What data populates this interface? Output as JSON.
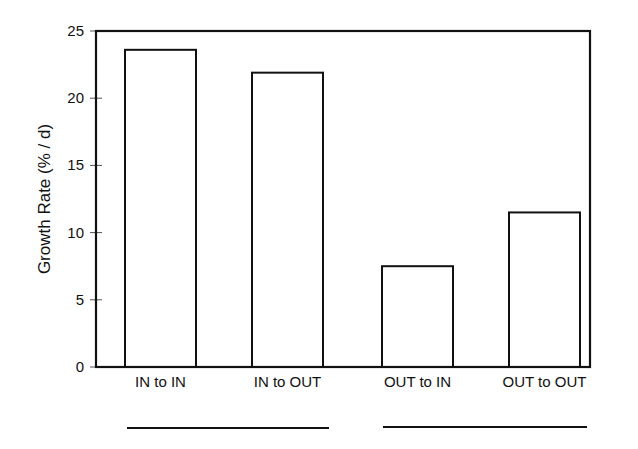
{
  "chart_data": {
    "type": "bar",
    "title": "",
    "xlabel": "",
    "ylabel": "Growth Rate (% / d)",
    "categories": [
      "IN to IN",
      "IN to OUT",
      "OUT to IN",
      "OUT to OUT"
    ],
    "values": [
      23.6,
      21.9,
      7.5,
      11.5
    ],
    "ylim": [
      0,
      25
    ],
    "yticks": [
      0,
      5,
      10,
      15,
      20,
      25
    ],
    "grid": false,
    "legend": null,
    "bar_fill": "#ffffff",
    "bar_edge": "#111111",
    "group_underlines": [
      {
        "covers": [
          "IN to IN",
          "IN to OUT"
        ]
      },
      {
        "covers": [
          "OUT to IN",
          "OUT to OUT"
        ]
      }
    ]
  }
}
